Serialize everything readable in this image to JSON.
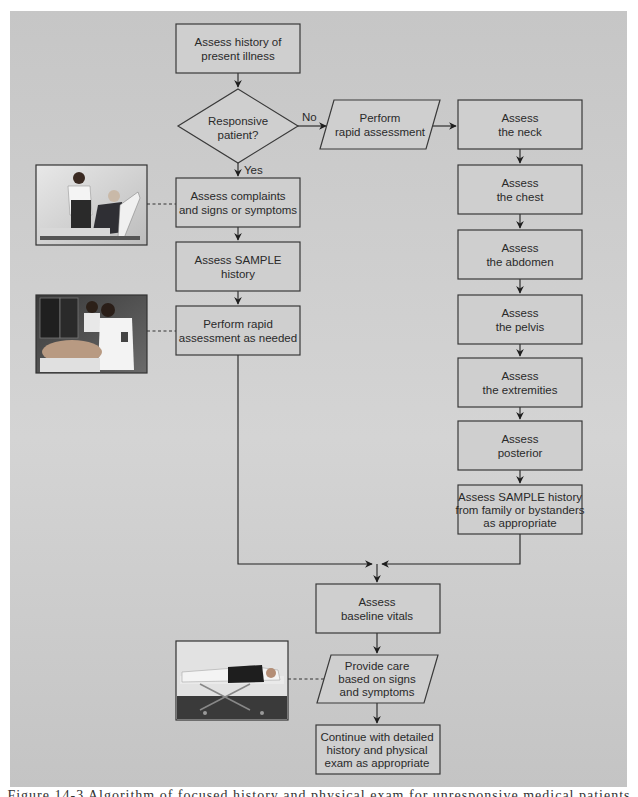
{
  "figure": {
    "panel_color": "#c8c8c8",
    "box_fill": "#cfcfcf",
    "box_stroke": "#3a3a3a",
    "line_color": "#2b2b2b",
    "caption_partial": "Figure 14-3 Algorithm of focused history and physical exam for unresponsive medical patients"
  },
  "nodes": {
    "history_present_illness": {
      "lines": [
        "Assess history of",
        "present illness"
      ]
    },
    "responsive_decision": {
      "lines": [
        "Responsive",
        "patient?"
      ]
    },
    "rapid_assessment": {
      "lines": [
        "Perform",
        "rapid assessment"
      ]
    },
    "assess_neck": {
      "lines": [
        "Assess",
        "the neck"
      ]
    },
    "assess_chest": {
      "lines": [
        "Assess",
        "the chest"
      ]
    },
    "assess_abdomen": {
      "lines": [
        "Assess",
        "the abdomen"
      ]
    },
    "assess_pelvis": {
      "lines": [
        "Assess",
        "the pelvis"
      ]
    },
    "assess_extremities": {
      "lines": [
        "Assess",
        "the extremities"
      ]
    },
    "assess_posterior": {
      "lines": [
        "Assess",
        "posterior"
      ]
    },
    "sample_family": {
      "lines": [
        "Assess SAMPLE history",
        "from family or bystanders",
        "as appropriate"
      ]
    },
    "assess_complaints": {
      "lines": [
        "Assess complaints",
        "and signs or symptoms"
      ]
    },
    "assess_sample": {
      "lines": [
        "Assess SAMPLE",
        "history"
      ]
    },
    "rapid_as_needed": {
      "lines": [
        "Perform rapid",
        "assessment as needed"
      ]
    },
    "baseline_vitals": {
      "lines": [
        "Assess",
        "baseline vitals"
      ]
    },
    "provide_care": {
      "lines": [
        "Provide care",
        "based on signs",
        "and symptoms"
      ]
    },
    "continue_exam": {
      "lines": [
        "Continue with detailed",
        "history and physical",
        "exam as  appropriate"
      ]
    }
  },
  "edge_labels": {
    "no": "No",
    "yes": "Yes"
  },
  "photos": [
    {
      "name": "photo-emt-talking-to-patient",
      "description": "EMT speaking with seated patient"
    },
    {
      "name": "photo-emts-assessing-patient",
      "description": "EMTs assessing patient in ambulance"
    },
    {
      "name": "photo-patient-on-stretcher",
      "description": "Patient lying on stretcher"
    }
  ]
}
